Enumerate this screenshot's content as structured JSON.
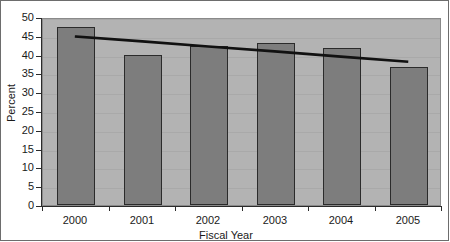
{
  "chart_data": {
    "type": "bar",
    "title": "",
    "subtitle": "",
    "xlabel": "Fiscal Year",
    "ylabel": "Percent",
    "categories": [
      "2000",
      "2001",
      "2002",
      "2003",
      "2004",
      "2005"
    ],
    "values": [
      47.3,
      39.8,
      42.2,
      43.0,
      41.7,
      36.8
    ],
    "series": [
      {
        "name": "Percent",
        "type": "bar",
        "values": [
          47.3,
          39.8,
          42.2,
          43.0,
          41.7,
          36.8
        ]
      },
      {
        "name": "Trend line",
        "type": "line",
        "values": [
          45.3,
          44.0,
          42.6,
          41.3,
          39.9,
          38.5
        ]
      }
    ],
    "ylim": [
      0,
      50
    ],
    "ytick_values": [
      0,
      5,
      10,
      15,
      20,
      25,
      30,
      35,
      40,
      45,
      50
    ],
    "ytick_labels": [
      "0",
      "5",
      "10",
      "15",
      "20",
      "25",
      "30",
      "35",
      "40",
      "45",
      "50"
    ],
    "xtick_labels": [
      "2000",
      "2001",
      "2002",
      "2003",
      "2004",
      "2005"
    ],
    "grid": true,
    "grid_axis": "y",
    "legend": false,
    "legend_position": "none",
    "annotations": [],
    "colors": {
      "bar_fill": "#7d7d7d",
      "bar_border": "#2b2b2b",
      "plot_background": "#b3b3b3",
      "gridline": "#a9a9a9",
      "trend_line": "#111111",
      "axis": "#2b2b2b",
      "text": "#1a1a1a",
      "page_background": "#ffffff"
    }
  }
}
